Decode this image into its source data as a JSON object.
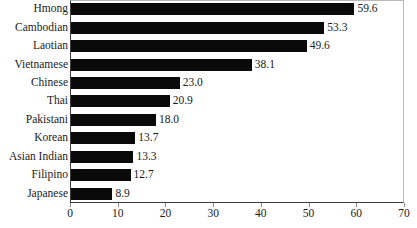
{
  "chart_data": {
    "type": "bar",
    "orientation": "horizontal",
    "title": "",
    "subtitle": "",
    "xlabel": "",
    "ylabel": "",
    "xlim": [
      0,
      70
    ],
    "xticks": [
      0,
      10,
      20,
      30,
      40,
      50,
      60,
      70
    ],
    "xtick_labels": [
      "0",
      "10",
      "20",
      "30",
      "40",
      "50",
      "60",
      "70"
    ],
    "grid": false,
    "legend": null,
    "bar_color": "#0a0a0a",
    "axis_color": "#3c3c3c",
    "categories": [
      "Hmong",
      "Cambodian",
      "Laotian",
      "Vietnamese",
      "Chinese",
      "Thai",
      "Pakistani",
      "Korean",
      "Asian Indian",
      "Filipino",
      "Japanese"
    ],
    "values": [
      59.6,
      53.3,
      49.6,
      38.1,
      23.0,
      20.9,
      18.0,
      13.7,
      13.3,
      12.7,
      8.9
    ],
    "value_labels": [
      "59.6",
      "53.3",
      "49.6",
      "38.1",
      "23.0",
      "20.9",
      "18.0",
      "13.7",
      "13.3",
      "12.7",
      "8.9"
    ],
    "bars": [
      {
        "label": "Hmong",
        "value": 59.6,
        "value_label": "59.6"
      },
      {
        "label": "Cambodian",
        "value": 53.3,
        "value_label": "53.3"
      },
      {
        "label": "Laotian",
        "value": 49.6,
        "value_label": "49.6"
      },
      {
        "label": "Vietnamese",
        "value": 38.1,
        "value_label": "38.1"
      },
      {
        "label": "Chinese",
        "value": 23.0,
        "value_label": "23.0"
      },
      {
        "label": "Thai",
        "value": 20.9,
        "value_label": "20.9"
      },
      {
        "label": "Pakistani",
        "value": 18.0,
        "value_label": "18.0"
      },
      {
        "label": "Korean",
        "value": 13.7,
        "value_label": "13.7"
      },
      {
        "label": "Asian Indian",
        "value": 13.3,
        "value_label": "13.3"
      },
      {
        "label": "Filipino",
        "value": 12.7,
        "value_label": "12.7"
      },
      {
        "label": "Japanese",
        "value": 8.9,
        "value_label": "8.9"
      }
    ]
  }
}
